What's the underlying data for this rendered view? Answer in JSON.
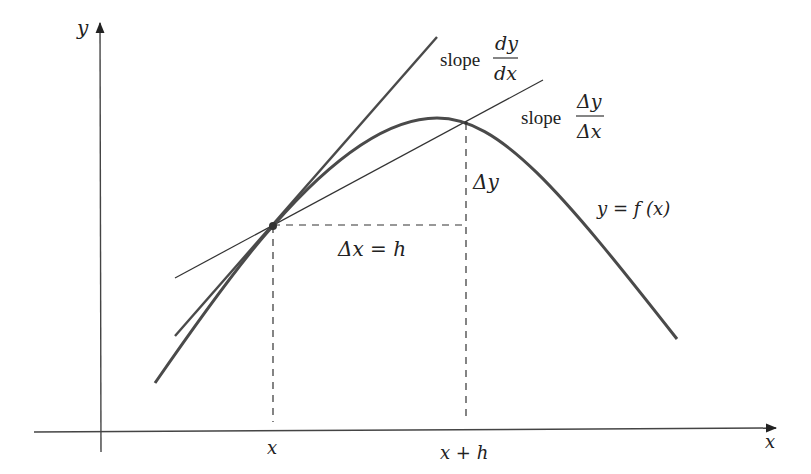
{
  "diagram": {
    "axes": {
      "x_label": "x",
      "y_label": "y"
    },
    "tick_labels": {
      "x": "x",
      "x_plus_h": "x + h"
    },
    "curve_label": "y = f (x)",
    "tangent_label": {
      "word": "slope",
      "numerator": "dy",
      "denominator": "dx"
    },
    "secant_label": {
      "word": "slope",
      "numerator": "Δy",
      "denominator": "Δx"
    },
    "delta_x_label": "Δx = h",
    "delta_y_label": "Δy",
    "colors": {
      "curve": "#4a4a4a",
      "lines": "#333333",
      "text": "#222222"
    }
  }
}
